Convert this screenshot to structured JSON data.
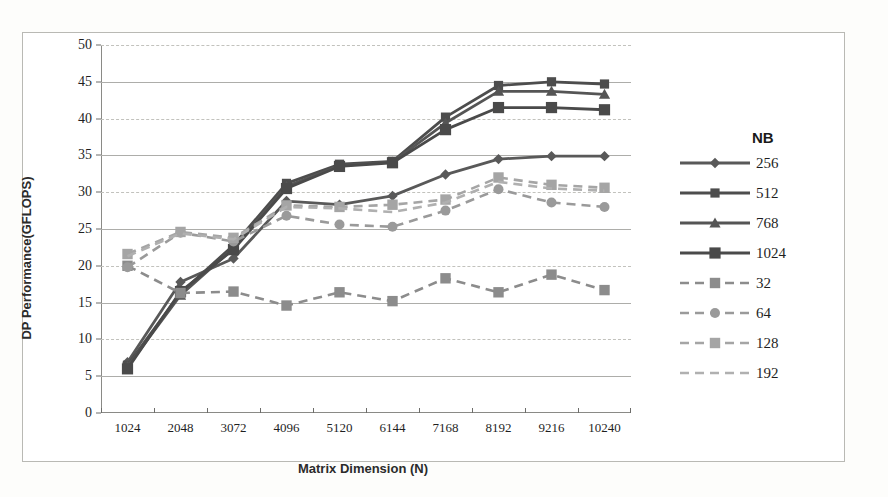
{
  "chart_data": {
    "type": "line",
    "title": "",
    "xlabel": "Matrix Dimension (N)",
    "ylabel": "DP Performance(GFLOPS)",
    "legend_title": "NB",
    "legend_position": "right",
    "grid": true,
    "categories": [
      1024,
      2048,
      3072,
      4096,
      5120,
      6144,
      7168,
      8192,
      9216,
      10240
    ],
    "xtick_labels": [
      "1024",
      "2048",
      "3072",
      "4096",
      "5120",
      "6144",
      "7168",
      "8192",
      "9216",
      "10240"
    ],
    "ytick_labels": [
      "0",
      "5",
      "10",
      "15",
      "20",
      "25",
      "30",
      "35",
      "40",
      "45",
      "50"
    ],
    "yticks": [
      0,
      5,
      10,
      15,
      20,
      25,
      30,
      35,
      40,
      45,
      50
    ],
    "ylim": [
      0,
      50
    ],
    "series": [
      {
        "name": "256",
        "marker": "diamond",
        "dashed": false,
        "color": "#595959",
        "values": [
          6.9,
          17.8,
          21.0,
          28.8,
          28.3,
          29.5,
          32.4,
          34.5,
          34.9,
          34.9
        ]
      },
      {
        "name": "512",
        "marker": "square",
        "dashed": false,
        "color": "#4d4d4d",
        "values": [
          6.5,
          16.3,
          22.8,
          31.2,
          33.8,
          34.2,
          40.2,
          44.5,
          45.0,
          44.7
        ]
      },
      {
        "name": "768",
        "marker": "triangle",
        "dashed": false,
        "color": "#555555",
        "values": [
          6.3,
          16.0,
          22.4,
          30.8,
          33.6,
          34.1,
          39.4,
          43.7,
          43.7,
          43.3
        ]
      },
      {
        "name": "1024",
        "marker": "square-large",
        "dashed": false,
        "color": "#4a4a4a",
        "values": [
          6.0,
          16.5,
          22.2,
          30.5,
          33.5,
          34.0,
          38.5,
          41.5,
          41.5,
          41.2
        ]
      },
      {
        "name": "32",
        "marker": "square-x",
        "dashed": true,
        "color": "#8c8c8c",
        "values": [
          20.0,
          16.3,
          16.5,
          14.6,
          16.4,
          15.2,
          18.3,
          16.4,
          18.8,
          16.7
        ]
      },
      {
        "name": "64",
        "marker": "circle",
        "dashed": true,
        "color": "#9a9a9a",
        "values": [
          19.8,
          24.5,
          23.3,
          26.8,
          25.6,
          25.3,
          27.5,
          30.4,
          28.6,
          28.0
        ]
      },
      {
        "name": "128",
        "marker": "square-shaded",
        "dashed": true,
        "color": "#a5a5a5",
        "values": [
          21.6,
          24.6,
          23.8,
          28.2,
          28.0,
          28.3,
          29.0,
          32.0,
          31.0,
          30.6
        ]
      },
      {
        "name": "192",
        "marker": "none",
        "dashed": true,
        "color": "#b0b0b0",
        "values": [
          21.3,
          24.4,
          23.6,
          28.0,
          27.8,
          27.3,
          28.6,
          31.4,
          30.5,
          30.2
        ]
      }
    ]
  },
  "legend": {
    "title": "NB",
    "items": [
      {
        "label": "256"
      },
      {
        "label": "512"
      },
      {
        "label": "768"
      },
      {
        "label": "1024"
      },
      {
        "label": "32"
      },
      {
        "label": "64"
      },
      {
        "label": "128"
      },
      {
        "label": "192"
      }
    ]
  },
  "axes": {
    "x_title": "Matrix Dimension (N)",
    "y_title": "DP Performance(GFLOPS)"
  }
}
